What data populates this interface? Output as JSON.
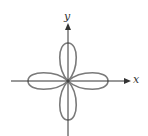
{
  "figure": {
    "type": "polar-rose",
    "axes": {
      "x_label": "x",
      "y_label": "y"
    },
    "curve": {
      "petals": 4,
      "petal_directions": [
        "right",
        "up",
        "left",
        "down"
      ],
      "stroke_color": "#7a7a7a"
    },
    "colors": {
      "axis": "#333333",
      "curve": "#7a7a7a",
      "background": "#ffffff"
    }
  }
}
